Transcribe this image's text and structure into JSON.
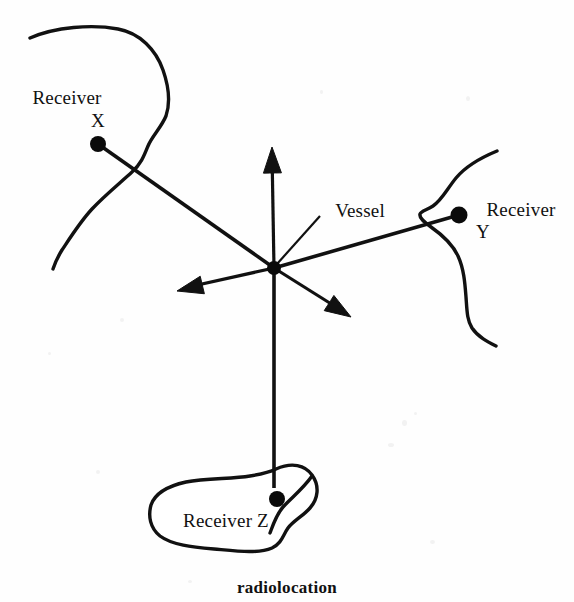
{
  "figure": {
    "caption": "radiolocation",
    "caption_x": 287,
    "caption_y": 578,
    "background_color": "#fefefe",
    "ink_color": "#111111",
    "width": 574,
    "height": 602
  },
  "labels": {
    "receiver_x_line1": "Receiver",
    "receiver_x_line2": "X",
    "receiver_y_line1": "Receiver",
    "receiver_y_line2": "Y",
    "receiver_z": "Receiver Z",
    "vessel": "Vessel"
  },
  "nodes": {
    "vessel": {
      "name": "Vessel",
      "x": 274,
      "y": 268,
      "radius": 7
    },
    "receiver_x": {
      "name": "Receiver X",
      "x": 98,
      "y": 144,
      "radius": 8
    },
    "receiver_y": {
      "name": "Receiver Y",
      "x": 459,
      "y": 215,
      "radius": 8.5
    },
    "receiver_z": {
      "name": "Receiver Z",
      "x": 277,
      "y": 499,
      "radius": 8
    }
  },
  "label_positions": {
    "receiver_x_line1": {
      "x": 67,
      "y": 104
    },
    "receiver_x_line2": {
      "x": 98,
      "y": 127
    },
    "receiver_y_line1": {
      "x": 521,
      "y": 216
    },
    "receiver_y_line2": {
      "x": 483,
      "y": 238
    },
    "receiver_z": {
      "x": 226,
      "y": 527
    },
    "vessel": {
      "x": 360,
      "y": 217
    }
  },
  "bearing_lines": [
    {
      "name": "vessel-to-receiver-x",
      "x1": 274,
      "y1": 268,
      "x2": 98,
      "y2": 144
    },
    {
      "name": "vessel-to-receiver-y",
      "x1": 274,
      "y1": 268,
      "x2": 459,
      "y2": 215
    },
    {
      "name": "vessel-to-receiver-z",
      "x1": 274,
      "y1": 268,
      "x2": 274,
      "y2": 488
    }
  ],
  "arrows": [
    {
      "name": "north-arrow",
      "x1": 274,
      "y1": 268,
      "x2": 272,
      "y2": 152,
      "tip_x": 272,
      "tip_y": 147
    },
    {
      "name": "southwest-arrow",
      "x1": 274,
      "y1": 268,
      "x2": 184,
      "y2": 288,
      "tip_x": 177,
      "tip_y": 291
    },
    {
      "name": "southeast-arrow",
      "x1": 274,
      "y1": 268,
      "x2": 344,
      "y2": 312,
      "tip_x": 351,
      "tip_y": 317
    }
  ],
  "leader": {
    "name": "vessel-leader",
    "x1": 320,
    "y1": 216,
    "x2": 277,
    "y2": 264
  },
  "coastlines": [
    {
      "name": "left-coastline",
      "path": "M 30 38 C 55 27, 92 24, 118 29 C 140 33, 156 50, 163 70 C 170 90, 170 104, 166 116 C 161 128, 152 136, 148 146 C 144 156, 141 164, 132 172 C 120 183, 104 196, 92 209 C 80 222, 70 238, 62 250 C 57 258, 55 263, 53 269"
    },
    {
      "name": "right-coastline",
      "path": "M 497 151 C 480 158, 466 166, 456 178 C 447 189, 442 200, 433 206 C 427 210, 421 211, 420 214 C 419 218, 424 222, 431 227 C 441 234, 452 243, 458 256 C 464 269, 465 284, 466 297 C 467 311, 467 320, 472 328 C 478 337, 488 342, 496 346"
    }
  ],
  "island": {
    "name": "receiver-z-island",
    "path": "M 276 469 C 292 462, 305 465, 312 475 C 320 486, 318 499, 310 508 C 303 516, 293 521, 288 528 C 283 535, 282 543, 272 548 C 258 554, 236 551, 214 549 C 192 547, 172 545, 160 536 C 150 528, 148 516, 151 505 C 155 493, 168 486, 186 482 C 206 478, 232 479, 250 476 C 263 474, 270 472, 276 469 Z"
  },
  "island_inlet": {
    "name": "receiver-z-inlet",
    "path": "M 312 476 C 303 489, 291 498, 283 507 C 276 515, 273 525, 270 533"
  },
  "specks": [
    {
      "x": 402,
      "y": 420,
      "w": 5,
      "h": 6
    },
    {
      "x": 414,
      "y": 412,
      "w": 3,
      "h": 3
    },
    {
      "x": 388,
      "y": 443,
      "w": 6,
      "h": 4
    },
    {
      "x": 120,
      "y": 318,
      "w": 4,
      "h": 4
    },
    {
      "x": 466,
      "y": 96,
      "w": 4,
      "h": 5
    },
    {
      "x": 48,
      "y": 352,
      "w": 3,
      "h": 3
    },
    {
      "x": 320,
      "y": 90,
      "w": 3,
      "h": 4
    },
    {
      "x": 188,
      "y": 580,
      "w": 4,
      "h": 3
    },
    {
      "x": 430,
      "y": 540,
      "w": 5,
      "h": 4
    },
    {
      "x": 96,
      "y": 470,
      "w": 4,
      "h": 4
    }
  ]
}
